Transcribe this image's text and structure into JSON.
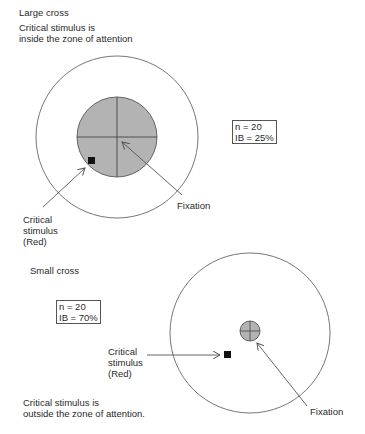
{
  "top_panel": {
    "heading": "Large cross",
    "caption_line1": "Critical stimulus is",
    "caption_line2": "inside the zone of attention",
    "stats": {
      "n": "n = 20",
      "ib": "IB = 25%"
    },
    "stimulus_label": {
      "line1": "Critical",
      "line2": "stimulus",
      "line3": "(Red)"
    },
    "fixation_label": "Fixation"
  },
  "bottom_panel": {
    "heading": "Small cross",
    "stats": {
      "n": "n = 20",
      "ib": "IB = 70%"
    },
    "stimulus_label": {
      "line1": "Critical",
      "line2": "stimulus",
      "line3": "(Red)"
    },
    "caption_line1": "Critical stimulus is",
    "caption_line2": "outside the zone of attention.",
    "fixation_label": "Fixation"
  },
  "colors": {
    "cross_fill": "#b3b3b3",
    "stroke": "#555555",
    "stimulus": "#111111"
  }
}
